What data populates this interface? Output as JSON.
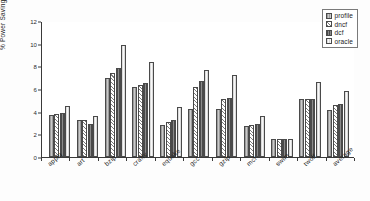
{
  "chart_data": {
    "type": "bar",
    "title": "",
    "xlabel": "",
    "ylabel": "% Power Savings",
    "ylim": [
      0,
      12
    ],
    "yticks": [
      0,
      2,
      4,
      6,
      8,
      10,
      12
    ],
    "grid": false,
    "legend_position": "top-right",
    "categories": [
      "applu",
      "art",
      "bzip",
      "crafty",
      "equake",
      "gcc",
      "gzip",
      "mcf",
      "swim",
      "twolf",
      "average"
    ],
    "series": [
      {
        "name": "profile",
        "values": [
          3.75,
          3.25,
          6.95,
          6.15,
          2.85,
          4.25,
          4.25,
          2.7,
          1.6,
          5.15,
          4.15
        ]
      },
      {
        "name": "dncf",
        "values": [
          3.8,
          3.25,
          7.45,
          6.35,
          3.1,
          6.2,
          5.1,
          2.85,
          1.6,
          5.15,
          4.55
        ]
      },
      {
        "name": "dcf",
        "values": [
          3.85,
          2.95,
          7.85,
          6.5,
          3.25,
          6.7,
          5.2,
          2.95,
          1.6,
          5.15,
          4.65
        ]
      },
      {
        "name": "oracle",
        "values": [
          4.5,
          3.6,
          9.9,
          8.4,
          4.4,
          7.7,
          7.25,
          3.6,
          1.6,
          6.6,
          5.85
        ]
      }
    ]
  },
  "legend": {
    "entries": [
      {
        "label": "profile"
      },
      {
        "label": "dncf"
      },
      {
        "label": "dcf"
      },
      {
        "label": "oracle"
      }
    ]
  },
  "colors": {
    "series_profile": "#b9b9b9",
    "series_dncf": "#f2f2f2",
    "series_dcf": "#6f6f6f",
    "series_oracle": "#ededed",
    "axis": "#3a3a3a",
    "text": "#1f1f1f",
    "background": "#ffffff"
  }
}
